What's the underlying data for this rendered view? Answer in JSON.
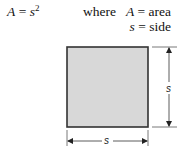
{
  "formula": {
    "lhs": "A",
    "equals": "=",
    "rhs_base": "s",
    "rhs_exponent": "2"
  },
  "legend": {
    "where_label": "where",
    "entries": [
      {
        "symbol": "A",
        "equals": "=",
        "meaning": "area"
      },
      {
        "symbol": "s",
        "equals": "=",
        "meaning": "side"
      }
    ]
  },
  "figure": {
    "shape": "square",
    "fill_color": "#d8d8d8",
    "stroke_color": "#333333",
    "vertical_dimension_label": "s",
    "horizontal_dimension_label": "s"
  }
}
